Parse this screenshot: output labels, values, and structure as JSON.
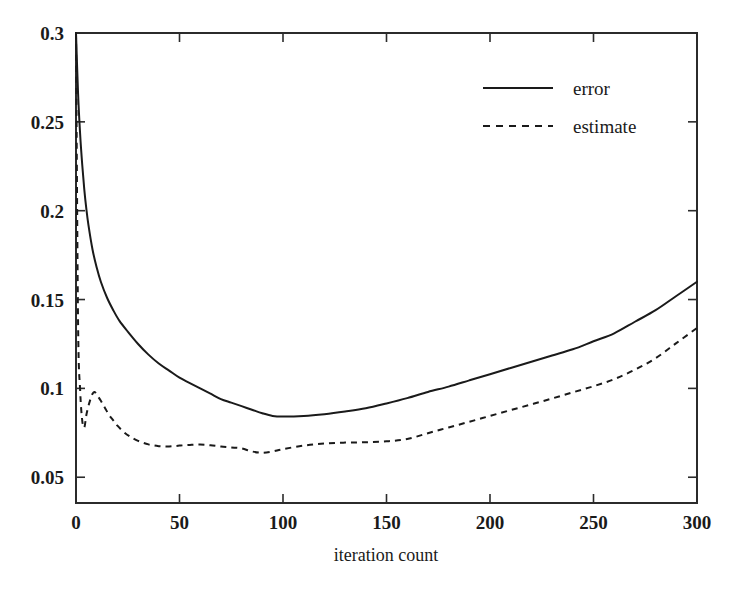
{
  "chart_data": {
    "type": "line",
    "title": "",
    "xlabel": "iteration count",
    "ylabel": "",
    "xlim": [
      0,
      300
    ],
    "ylim": [
      0.0355,
      0.3
    ],
    "grid": false,
    "legend_position": "top-right",
    "x_ticks": [
      "0",
      "50",
      "100",
      "150",
      "200",
      "250",
      "300"
    ],
    "x_tick_values": [
      0,
      50,
      100,
      150,
      200,
      250,
      300
    ],
    "y_ticks": [
      "0.05",
      "0.1",
      "0.15",
      "0.2",
      "0.25",
      "0.3"
    ],
    "y_tick_values": [
      0.05,
      0.1,
      0.15,
      0.2,
      0.25,
      0.3
    ],
    "series": [
      {
        "name": "error",
        "style": "solid",
        "color": "#1a1a1a",
        "x": [
          0,
          1,
          2,
          3,
          4,
          5,
          6,
          8,
          10,
          12,
          15,
          18,
          21,
          25,
          30,
          35,
          40,
          45,
          50,
          55,
          60,
          65,
          70,
          75,
          80,
          85,
          90,
          95,
          100,
          110,
          120,
          130,
          140,
          150,
          160,
          170,
          180,
          190,
          200,
          210,
          220,
          230,
          240,
          250,
          260,
          270,
          280,
          290,
          300
        ],
        "values": [
          0.3,
          0.266,
          0.243,
          0.226,
          0.212,
          0.201,
          0.192,
          0.178,
          0.168,
          0.16,
          0.151,
          0.144,
          0.138,
          0.132,
          0.125,
          0.119,
          0.114,
          0.11,
          0.106,
          0.103,
          0.1,
          0.097,
          0.094,
          0.092,
          0.09,
          0.088,
          0.086,
          0.0845,
          0.0842,
          0.0845,
          0.0855,
          0.087,
          0.0888,
          0.0915,
          0.0945,
          0.098,
          0.101,
          0.1045,
          0.108,
          0.1115,
          0.115,
          0.1185,
          0.122,
          0.1265,
          0.131,
          0.1375,
          0.144,
          0.152,
          0.16
        ]
      },
      {
        "name": "estimate",
        "style": "dashed",
        "color": "#1a1a1a",
        "x": [
          0,
          1,
          2,
          3,
          4,
          5,
          6,
          7,
          8,
          9,
          10,
          12,
          14,
          16,
          18,
          20,
          23,
          26,
          30,
          35,
          40,
          45,
          50,
          55,
          60,
          65,
          70,
          75,
          80,
          85,
          90,
          95,
          100,
          110,
          120,
          130,
          140,
          150,
          160,
          170,
          180,
          190,
          200,
          210,
          220,
          230,
          240,
          250,
          260,
          270,
          280,
          290,
          300
        ],
        "values": [
          0.3,
          0.137,
          0.099,
          0.082,
          0.078,
          0.085,
          0.09,
          0.094,
          0.097,
          0.098,
          0.0965,
          0.093,
          0.089,
          0.085,
          0.082,
          0.079,
          0.0755,
          0.073,
          0.0705,
          0.0685,
          0.0675,
          0.0673,
          0.0678,
          0.0682,
          0.0684,
          0.068,
          0.0673,
          0.0668,
          0.0662,
          0.0645,
          0.0638,
          0.0645,
          0.0658,
          0.0678,
          0.069,
          0.0695,
          0.0697,
          0.0702,
          0.0715,
          0.0748,
          0.078,
          0.0812,
          0.0845,
          0.0878,
          0.091,
          0.0943,
          0.0978,
          0.1012,
          0.1052,
          0.1105,
          0.117,
          0.1255,
          0.134
        ]
      }
    ]
  },
  "legend": {
    "items": [
      {
        "label": "error",
        "style": "solid"
      },
      {
        "label": "estimate",
        "style": "dashed"
      }
    ]
  },
  "axes": {
    "x_label": "iteration count"
  }
}
